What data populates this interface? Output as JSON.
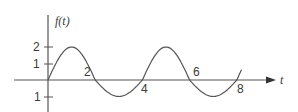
{
  "chart_data": {
    "type": "line",
    "title": "",
    "xlabel": "t",
    "ylabel": "f(t)",
    "x_tick_labels": [
      "2",
      "4",
      "6",
      "8"
    ],
    "x_ticks": [
      2,
      4,
      6,
      8
    ],
    "y_tick_labels": [
      "2",
      "1",
      "1"
    ],
    "y_ticks": [
      2,
      1,
      -1
    ],
    "xlim": [
      -1.4,
      9.6
    ],
    "ylim": [
      -2,
      4
    ],
    "grid": false,
    "legend": null,
    "series": [
      {
        "name": "f(t)",
        "description": "periodic waveform, period 4: positive half-cycle peak 2 on [0,2], negative half-cycle trough -1 on [2,4]",
        "x": [
          0,
          0.5,
          1,
          1.5,
          2,
          2.5,
          3,
          3.5,
          4,
          4.5,
          5,
          5.5,
          6,
          6.5,
          7,
          7.5,
          8,
          8.2
        ],
        "y": [
          0,
          1.41,
          2,
          1.41,
          0,
          -0.71,
          -1,
          -0.71,
          0,
          1.41,
          2,
          1.41,
          0,
          -0.71,
          -1,
          -0.71,
          0,
          0.31
        ]
      }
    ]
  },
  "labels": {
    "y_axis": "f(t)",
    "x_axis": "t",
    "y_tick_2": "2",
    "y_tick_1": "1",
    "y_tick_neg1": "1",
    "x_tick_2": "2",
    "x_tick_4": "4",
    "x_tick_6": "6",
    "x_tick_8": "8"
  }
}
